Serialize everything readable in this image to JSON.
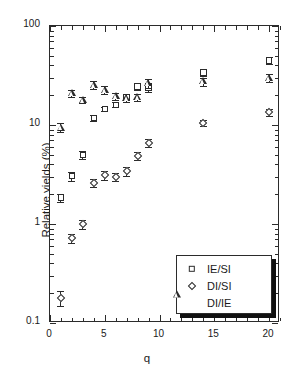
{
  "chart_data": {
    "type": "scatter",
    "title": "",
    "xlabel": "q",
    "ylabel": "Relative yields  (%)",
    "xlim": [
      0,
      21
    ],
    "ylim": [
      0.1,
      100
    ],
    "yscale": "log",
    "xscale": "linear",
    "grid": false,
    "legend_position": "bottom-right",
    "x_ticks": [
      0,
      5,
      10,
      15,
      20
    ],
    "x_tick_labels": [
      "0",
      "5",
      "10",
      "15",
      "20"
    ],
    "y_ticks": [
      0.1,
      1,
      10,
      100
    ],
    "y_tick_labels": [
      "0.1",
      "1",
      "10",
      "100"
    ],
    "x": [
      1,
      2,
      3,
      4,
      5,
      6,
      7,
      8,
      9,
      14,
      20
    ],
    "series": [
      {
        "name": "IE/SI",
        "marker": "square",
        "values": [
          1.85,
          3.05,
          5.0,
          11.8,
          14.5,
          16.0,
          19.0,
          24.5,
          24.0,
          34.0,
          45.0
        ],
        "errors": [
          0.18,
          0.3,
          0.45,
          0.7,
          0.8,
          0.9,
          1.2,
          1.8,
          2.4,
          2.6,
          3.4
        ]
      },
      {
        "name": "DI/SI",
        "marker": "diamond",
        "values": [
          0.18,
          0.72,
          1.0,
          2.6,
          3.1,
          3.0,
          3.4,
          4.9,
          6.6,
          10.5,
          13.4
        ],
        "errors": [
          0.03,
          0.07,
          0.1,
          0.25,
          0.3,
          0.3,
          0.35,
          0.45,
          0.6,
          0.8,
          1.1
        ]
      },
      {
        "name": "DI/IE",
        "marker": "triangle",
        "values": [
          9.4,
          21.0,
          18.0,
          25.5,
          22.5,
          19.5,
          18.8,
          19.0,
          26.5,
          27.5,
          30.0
        ],
        "errors": [
          1.0,
          1.6,
          1.4,
          2.2,
          2.0,
          1.7,
          1.6,
          1.7,
          2.6,
          2.6,
          2.9
        ]
      }
    ]
  },
  "legend": {
    "entries": [
      {
        "label": "IE/SI",
        "marker": "square"
      },
      {
        "label": "DI/SI",
        "marker": "diamond"
      },
      {
        "label": "DI/IE",
        "marker": "triangle"
      }
    ]
  },
  "colors": {
    "axis": "#2b2b2b",
    "marker": "#2b2b2b",
    "background": "#ffffff",
    "legend_shadow": "#111111"
  }
}
